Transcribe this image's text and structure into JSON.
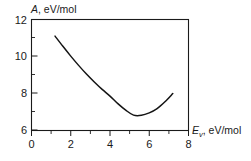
{
  "chart_data": {
    "type": "line",
    "title": "",
    "subtitle": "",
    "ylabel_symbol": "A",
    "ylabel_units": ", eV/mol",
    "ylabel_full": "A, eV/mol",
    "xlabel_symbol": "E",
    "xlabel_subscript": "v",
    "xlabel_units": ", eV/mol",
    "xlabel_full": "Ev, eV/mol",
    "xlim": [
      0,
      8
    ],
    "ylim": [
      6,
      12
    ],
    "x_major_ticks": [
      0,
      2,
      4,
      6,
      8
    ],
    "x_minor_ticks": [
      1,
      3,
      5,
      7
    ],
    "y_major_ticks": [
      6,
      8,
      10,
      12
    ],
    "y_minor_ticks": [
      7,
      9,
      11
    ],
    "x_tick_labels": [
      "0",
      "2",
      "4",
      "6",
      "8"
    ],
    "y_tick_labels": [
      "6",
      "8",
      "10",
      "12"
    ],
    "grid": false,
    "legend": null,
    "legend_position": "none",
    "series": [
      {
        "name": "A(Ev)",
        "color": "#141414",
        "x": [
          1.2,
          1.6,
          2.0,
          2.4,
          2.8,
          3.2,
          3.6,
          4.0,
          4.4,
          4.8,
          5.2,
          5.6,
          6.0,
          6.4,
          6.8,
          7.2
        ],
        "y": [
          11.1,
          10.55,
          10.02,
          9.52,
          9.05,
          8.62,
          8.22,
          7.86,
          7.45,
          7.1,
          6.83,
          6.82,
          6.95,
          7.18,
          7.55,
          8.0
        ]
      }
    ],
    "annotations": [],
    "minimum_point": {
      "x": 5.35,
      "y": 6.8
    }
  },
  "figure": {
    "background_color": "#ffffff",
    "axis_color": "#1a1a1a",
    "curve_color": "#141414"
  }
}
